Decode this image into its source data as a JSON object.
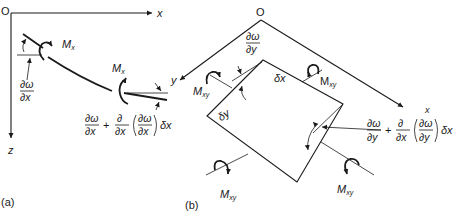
{
  "figure": {
    "panel_a": {
      "caption": "(a)",
      "origin": "O",
      "axis_x": "x",
      "axis_z": "z",
      "moment_left": {
        "main": "M",
        "sub": "x"
      },
      "moment_right": {
        "main": "M",
        "sub": "x"
      },
      "slope_left": {
        "num": "∂ω",
        "den": "∂x"
      },
      "slope_right": {
        "t1_num": "∂ω",
        "t1_den": "∂x",
        "plus": "+",
        "t2_num": "∂",
        "t2_den": "∂x",
        "paren_num": "∂ω",
        "paren_den": "∂x",
        "tail": "δx"
      }
    },
    "panel_b": {
      "caption": "(b)",
      "origin": "O",
      "axis_x": "x",
      "axis_y": "y",
      "edge_dx": "δx",
      "edge_dy": "δy",
      "slope_top": {
        "num": "∂ω",
        "den": "∂y"
      },
      "slope_right": {
        "t1_num": "∂ω",
        "t1_den": "∂y",
        "plus": "+",
        "t2_num": "∂",
        "t2_den": "∂x",
        "paren_num": "∂ω",
        "paren_den": "∂y",
        "tail": "δx"
      },
      "moments": [
        {
          "main": "M",
          "sub": "xy"
        },
        {
          "main": "M",
          "sub": "xy"
        },
        {
          "main": "M",
          "sub": "xy"
        },
        {
          "main": "M",
          "sub": "xy"
        }
      ]
    }
  }
}
